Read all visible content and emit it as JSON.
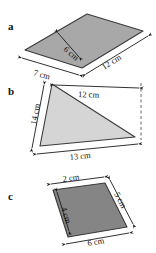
{
  "figure": {
    "background_color": "#ffffff",
    "panels": [
      {
        "letter": "a",
        "shape": "parallelogram",
        "fill_color": "#a8a8a8",
        "stroke_color": "#3a3a3a",
        "dimensions": [
          {
            "label": "6 cm",
            "position": "interior-height"
          },
          {
            "label": "7 cm",
            "position": "bottom-left-edge"
          },
          {
            "label": "12 cm",
            "position": "bottom-right-edge"
          }
        ]
      },
      {
        "letter": "b",
        "shape": "triangle",
        "fill_color": "#d5d5d5",
        "stroke_color": "#3a3a3a",
        "dimensions": [
          {
            "label": "14 cm",
            "position": "left-edge"
          },
          {
            "label": "12 cm",
            "position": "top-edge"
          },
          {
            "label": "13 cm",
            "position": "bottom-edge"
          }
        ],
        "has_dashed_guide": true
      },
      {
        "letter": "c",
        "shape": "trapezium",
        "fill_color": "#858585",
        "stroke_color": "#2a2a2a",
        "dimensions": [
          {
            "label": "2 cm",
            "position": "top-edge"
          },
          {
            "label": "5 cm",
            "position": "right-edge"
          },
          {
            "label": "4 cm",
            "position": "interior-height"
          },
          {
            "label": "6 cm",
            "position": "bottom-edge"
          }
        ]
      }
    ]
  }
}
